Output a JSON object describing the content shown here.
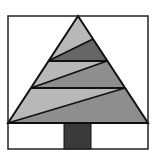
{
  "figure": {
    "frame": {
      "x1": 8,
      "y1": 16,
      "x2": 148,
      "y2": 149
    },
    "colors": {
      "background": "#ffffff",
      "outline": "#111111",
      "light": "#b8b8b8",
      "medium": "#8e8e8e",
      "dark": "#666666",
      "trunk": "#3a3a3a"
    },
    "tree": {
      "apex": [
        78,
        16
      ],
      "base_left": [
        8,
        123
      ],
      "base_right": [
        148,
        123
      ]
    },
    "trunk": {
      "x": 64,
      "y": 123,
      "w": 27,
      "h": 26
    },
    "bands": [
      {
        "name": "top-light",
        "points": "78,16 93,39 48,61",
        "fill": "light"
      },
      {
        "name": "top-dark",
        "points": "93,39 107,61 48,61",
        "fill": "dark"
      },
      {
        "name": "middle-light",
        "points": "48,61 107,61 31,88",
        "fill": "light"
      },
      {
        "name": "middle-medium",
        "points": "107,61 125,88 31,88",
        "fill": "medium"
      },
      {
        "name": "bottom-light",
        "points": "31,88 125,88 8,123",
        "fill": "light"
      },
      {
        "name": "bottom-medium",
        "points": "125,88 148,123 8,123",
        "fill": "medium"
      }
    ],
    "lines": [
      {
        "name": "diag-1",
        "x1": 93,
        "y1": 39,
        "x2": 48,
        "y2": 61
      },
      {
        "name": "horiz-1",
        "x1": 48,
        "y1": 61,
        "x2": 107,
        "y2": 61
      },
      {
        "name": "diag-2",
        "x1": 107,
        "y1": 61,
        "x2": 31,
        "y2": 88
      },
      {
        "name": "horiz-2",
        "x1": 31,
        "y1": 88,
        "x2": 125,
        "y2": 88
      },
      {
        "name": "diag-3",
        "x1": 125,
        "y1": 88,
        "x2": 8,
        "y2": 123
      }
    ]
  }
}
